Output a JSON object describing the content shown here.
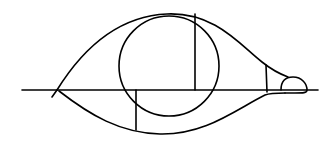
{
  "diagram": {
    "stroke_color": "#000000",
    "background_color": "#ffffff",
    "elements": [
      {
        "name": "horizontal-axis",
        "type": "line"
      },
      {
        "name": "upper-outline-curve",
        "type": "curve"
      },
      {
        "name": "lower-outline-curve",
        "type": "curve"
      },
      {
        "name": "inner-circle",
        "type": "circle"
      },
      {
        "name": "upper-vertical-line",
        "type": "line"
      },
      {
        "name": "lower-vertical-line",
        "type": "line"
      },
      {
        "name": "tip-vertical-line",
        "type": "line"
      },
      {
        "name": "tip-bulb",
        "type": "curve"
      }
    ]
  }
}
